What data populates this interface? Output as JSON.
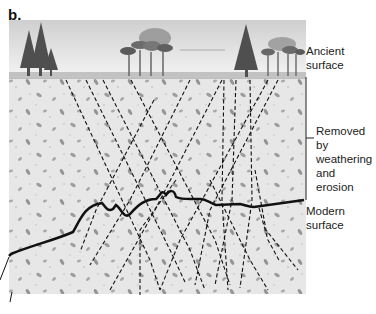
{
  "figure": {
    "panel_label": "b.",
    "labels": {
      "ancient_surface_line1": "Ancient",
      "ancient_surface_line2": "surface",
      "removed_line1": "Removed by",
      "removed_line2": "weathering",
      "removed_line3": "and erosion",
      "modern_surface_line1": "Modern",
      "modern_surface_line2": "surface"
    },
    "colors": {
      "sky_top": "#d6d6d6",
      "sky_bottom": "#f2f2f2",
      "ground": "#e6e6e6",
      "pebble": "#9a9a9a",
      "tree": "#555555",
      "line": "#111111"
    }
  }
}
